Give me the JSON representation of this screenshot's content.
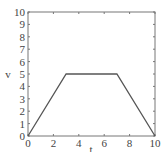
{
  "chart_data": {
    "type": "line",
    "title": "",
    "xlabel": "t",
    "ylabel": "v",
    "xlim": [
      0,
      10
    ],
    "ylim": [
      0,
      10
    ],
    "xticks": [
      0,
      2,
      4,
      6,
      8,
      10
    ],
    "yticks": [
      0,
      1,
      2,
      3,
      4,
      5,
      6,
      7,
      8,
      9,
      10
    ],
    "grid": false,
    "legend": null,
    "series": [
      {
        "name": "v(t)",
        "x": [
          0,
          3,
          7,
          10
        ],
        "y": [
          0,
          5,
          5,
          0
        ],
        "color": "#555555"
      }
    ]
  },
  "style": {
    "axis_color": "#777777",
    "line_color": "#555555"
  }
}
